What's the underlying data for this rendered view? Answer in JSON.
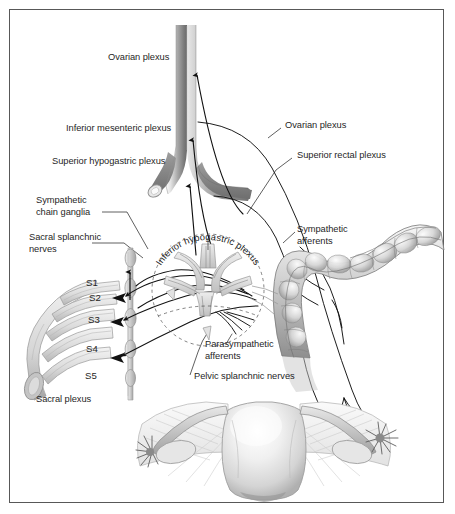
{
  "figure": {
    "border_color": "#585858",
    "background_color": "#ffffff",
    "text_color": "#1f1f1f",
    "width": 455,
    "height": 514
  },
  "labels": {
    "ovarian_plexus_left": "Ovarian plexus",
    "inferior_mesenteric_plexus": "Inferior mesenteric plexus",
    "superior_hypogastric_plexus": "Superior hypogastric plexus",
    "sympathetic_chain_ganglia_1": "Sympathetic",
    "sympathetic_chain_ganglia_2": "chain ganglia",
    "sacral_splanchnic_nerves_1": "Sacral splanchnic",
    "sacral_splanchnic_nerves_2": "nerves",
    "sacral_plexus": "Sacral plexus",
    "ovarian_plexus_right": "Ovarian plexus",
    "superior_rectal_plexus": "Superior rectal plexus",
    "sympathetic_afferents_1": "Sympathetic",
    "sympathetic_afferents_2": "afferents",
    "parasympathetic_afferents_1": "Parasympathetic",
    "parasympathetic_afferents_2": "afferents",
    "pelvic_splanchnic_nerves": "Pelvic splanchnic nerves",
    "inferior_hypogastric_plexus": "Inferior hypogastric plexus"
  },
  "sacral_segments": [
    {
      "id": "s1",
      "label": "S1"
    },
    {
      "id": "s2",
      "label": "S2"
    },
    {
      "id": "s3",
      "label": "S3"
    },
    {
      "id": "s4",
      "label": "S4"
    },
    {
      "id": "s5",
      "label": "S5"
    }
  ],
  "anatomy": {
    "aorta": "abdominal-aorta-with-bifurcation",
    "colon": "sigmoid-and-descending-colon",
    "uterus": "uterus-with-fallopian-tubes-and-ovaries",
    "sacral_plexus_trunk": "sacral-nerve-roots",
    "sympathetic_trunk": "sympathetic-chain",
    "inferior_hypogastric_plexus": "pelvic-nerve-mesh"
  },
  "colors": {
    "vessel_light": "#efefef",
    "vessel_mid": "#9a9a9a",
    "vessel_dark": "#6d6d6d",
    "nerve_line": "#1a1a1a",
    "organ_light": "#f2f2f2",
    "organ_mid": "#c6c6c6",
    "organ_shade": "#a0a0a0",
    "dashed_guide": "#4a4a4a"
  }
}
